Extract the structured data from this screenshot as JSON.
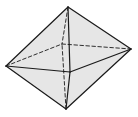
{
  "diagram": {
    "type": "octahedron",
    "colors": {
      "face": "#e6e6e6",
      "edge": "#1a1a1a",
      "background": "#ffffff"
    },
    "vertices": {
      "top": [
        68,
        7
      ],
      "bottom": [
        66,
        109
      ],
      "left": [
        6,
        66
      ],
      "right": [
        131,
        49
      ],
      "front": [
        70,
        72
      ],
      "back": [
        62,
        44
      ]
    },
    "visible_edges": [
      [
        "top",
        "left"
      ],
      [
        "top",
        "right"
      ],
      [
        "top",
        "front"
      ],
      [
        "bottom",
        "left"
      ],
      [
        "bottom",
        "right"
      ],
      [
        "bottom",
        "front"
      ],
      [
        "left",
        "front"
      ],
      [
        "front",
        "right"
      ]
    ],
    "hidden_edges": [
      [
        "top",
        "back"
      ],
      [
        "bottom",
        "back"
      ],
      [
        "left",
        "back"
      ],
      [
        "back",
        "right"
      ]
    ]
  }
}
